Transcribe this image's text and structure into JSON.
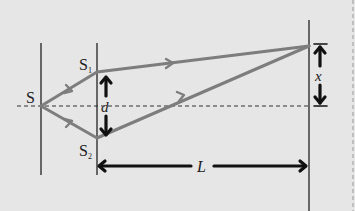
{
  "diagram": {
    "labels": {
      "source": "S",
      "slit1": "S",
      "slit1_sub": "1",
      "slit2": "S",
      "slit2_sub": "2",
      "slit_separation": "d",
      "screen_distance": "L",
      "fringe_position": "x"
    },
    "colors": {
      "background": "#e6e6e6",
      "rays": "#7d7d7d",
      "lines": "#222222",
      "arrows": "#111111",
      "border": "#999999"
    },
    "geometry": {
      "source_point": [
        41,
        106
      ],
      "slit1_point": [
        97,
        72
      ],
      "slit2_point": [
        97,
        138
      ],
      "screen_point": [
        309,
        46
      ],
      "centerline_y": 106
    }
  }
}
